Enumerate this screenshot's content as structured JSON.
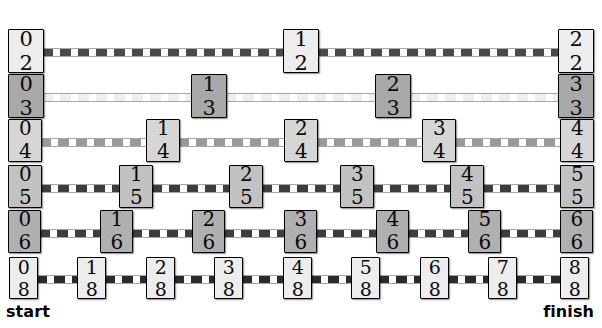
{
  "diagram": {
    "start_label": "start",
    "finish_label": "finish",
    "background_color": "#ffffff",
    "rows": [
      {
        "name": "halves",
        "denominator": 2,
        "box_fill": "#ededed",
        "dash_color": "#4a4a4a",
        "top": 29,
        "box_w": 36,
        "box_h": 44,
        "font_size": 21,
        "cells": [
          {
            "numerator": "0",
            "denominator": "2",
            "label": "0/2",
            "x": 8
          },
          {
            "numerator": "1",
            "denominator": "2",
            "label": "1/2",
            "x": 283
          },
          {
            "numerator": "2",
            "denominator": "2",
            "label": "2/2",
            "x": 558
          }
        ]
      },
      {
        "name": "thirds",
        "denominator": 3,
        "box_fill": "#a8a8a8",
        "dash_color": "#efefef",
        "top": 74,
        "box_w": 36,
        "box_h": 44,
        "font_size": 21,
        "cells": [
          {
            "numerator": "0",
            "denominator": "3",
            "label": "0/3",
            "x": 8
          },
          {
            "numerator": "1",
            "denominator": "3",
            "label": "1/3",
            "x": 191
          },
          {
            "numerator": "2",
            "denominator": "3",
            "label": "2/3",
            "x": 375
          },
          {
            "numerator": "3",
            "denominator": "3",
            "label": "3/3",
            "x": 558
          }
        ]
      },
      {
        "name": "fourths",
        "denominator": 4,
        "box_fill": "#d6d6d6",
        "dash_color": "#9a9a9a",
        "top": 119,
        "box_w": 34,
        "box_h": 43,
        "font_size": 20,
        "cells": [
          {
            "numerator": "0",
            "denominator": "4",
            "label": "0/4",
            "x": 8
          },
          {
            "numerator": "1",
            "denominator": "4",
            "label": "1/4",
            "x": 146
          },
          {
            "numerator": "2",
            "denominator": "4",
            "label": "2/4",
            "x": 284
          },
          {
            "numerator": "3",
            "denominator": "4",
            "label": "3/4",
            "x": 422
          },
          {
            "numerator": "4",
            "denominator": "4",
            "label": "4/4",
            "x": 560
          }
        ]
      },
      {
        "name": "fifths",
        "denominator": 5,
        "box_fill": "#c2c2c2",
        "dash_color": "#3d3d3d",
        "top": 165,
        "box_w": 34,
        "box_h": 43,
        "font_size": 20,
        "cells": [
          {
            "numerator": "0",
            "denominator": "5",
            "label": "0/5",
            "x": 8
          },
          {
            "numerator": "1",
            "denominator": "5",
            "label": "1/5",
            "x": 119
          },
          {
            "numerator": "2",
            "denominator": "5",
            "label": "2/5",
            "x": 229
          },
          {
            "numerator": "3",
            "denominator": "5",
            "label": "3/5",
            "x": 340
          },
          {
            "numerator": "4",
            "denominator": "5",
            "label": "4/5",
            "x": 450
          },
          {
            "numerator": "5",
            "denominator": "5",
            "label": "5/5",
            "x": 560
          }
        ]
      },
      {
        "name": "sixths",
        "denominator": 6,
        "box_fill": "#b0b0b0",
        "dash_color": "#3d3d3d",
        "top": 210,
        "box_w": 33,
        "box_h": 43,
        "font_size": 20,
        "cells": [
          {
            "numerator": "0",
            "denominator": "6",
            "label": "0/6",
            "x": 8
          },
          {
            "numerator": "1",
            "denominator": "6",
            "label": "1/6",
            "x": 100
          },
          {
            "numerator": "2",
            "denominator": "6",
            "label": "2/6",
            "x": 192
          },
          {
            "numerator": "3",
            "denominator": "6",
            "label": "3/6",
            "x": 284
          },
          {
            "numerator": "4",
            "denominator": "6",
            "label": "4/6",
            "x": 376
          },
          {
            "numerator": "5",
            "denominator": "6",
            "label": "5/6",
            "x": 468
          },
          {
            "numerator": "6",
            "denominator": "6",
            "label": "6/6",
            "x": 560
          }
        ]
      },
      {
        "name": "eighths",
        "denominator": 8,
        "box_fill": "#ededed",
        "dash_color": "#2b2b2b",
        "top": 257,
        "box_w": 29,
        "box_h": 42,
        "font_size": 19,
        "cells": [
          {
            "numerator": "0",
            "denominator": "8",
            "label": "0/8",
            "x": 9
          },
          {
            "numerator": "1",
            "denominator": "8",
            "label": "1/8",
            "x": 77
          },
          {
            "numerator": "2",
            "denominator": "8",
            "label": "2/8",
            "x": 146
          },
          {
            "numerator": "3",
            "denominator": "8",
            "label": "3/8",
            "x": 214
          },
          {
            "numerator": "4",
            "denominator": "8",
            "label": "4/8",
            "x": 283
          },
          {
            "numerator": "5",
            "denominator": "8",
            "label": "5/8",
            "x": 351
          },
          {
            "numerator": "6",
            "denominator": "8",
            "label": "6/8",
            "x": 420
          },
          {
            "numerator": "7",
            "denominator": "8",
            "label": "7/8",
            "x": 488
          },
          {
            "numerator": "8",
            "denominator": "8",
            "label": "8/8",
            "x": 560
          }
        ]
      }
    ]
  }
}
